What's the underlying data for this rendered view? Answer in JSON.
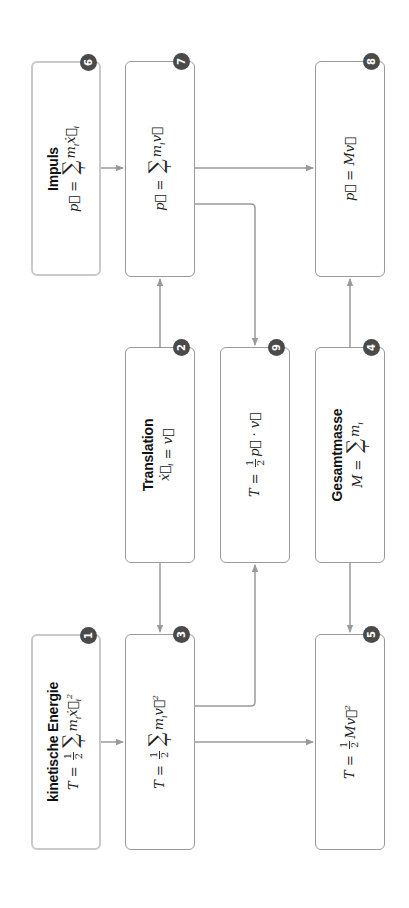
{
  "diagram": {
    "language": "de",
    "colors": {
      "box_border": "#9a9a9a",
      "box_border_light": "#c9c9c9",
      "badge_fill": "#4a4a4a",
      "badge_text": "#ffffff",
      "connector": "#9a9a9a"
    },
    "boxes": [
      {
        "id": 1,
        "badge": "1",
        "title": "kinetische Energie",
        "formula": "T = 1/2 Σ_i m_i ẋ_i²",
        "formula_parts": {
          "lhs": "T =",
          "frac_num": "1",
          "frac_den": "2",
          "sum_index": "i",
          "term": "m",
          "term_sub": "i",
          "term2": "ẋ",
          "term2_sub": "i",
          "term2_sup": "2"
        }
      },
      {
        "id": 2,
        "badge": "2",
        "title": "Translation",
        "formula": "ẋ_i = v",
        "formula_parts": {
          "lhs": "ẋ",
          "lhs_sub": "i",
          "eq": "=",
          "rhs": "v"
        }
      },
      {
        "id": 3,
        "badge": "3",
        "title": "",
        "formula": "T = 1/2 Σ_i m_i v²",
        "formula_parts": {
          "lhs": "T =",
          "frac_num": "1",
          "frac_den": "2",
          "sum_index": "i",
          "term": "m",
          "term_sub": "i",
          "term2": "v",
          "term2_sup": "2"
        }
      },
      {
        "id": 4,
        "badge": "4",
        "title": "Gesamtmasse",
        "formula": "M = Σ_i m_i",
        "formula_parts": {
          "lhs": "M =",
          "sum_index": "i",
          "term": "m",
          "term_sub": "i"
        }
      },
      {
        "id": 5,
        "badge": "5",
        "title": "",
        "formula": "T = 1/2 M v²",
        "formula_parts": {
          "lhs": "T =",
          "frac_num": "1",
          "frac_den": "2",
          "term": "M",
          "term2": "v",
          "term2_sup": "2"
        }
      },
      {
        "id": 6,
        "badge": "6",
        "title": "Impuls",
        "formula": "p = Σ_i m_i ẋ_i",
        "formula_parts": {
          "lhs": "p =",
          "sum_index": "i",
          "term": "m",
          "term_sub": "i",
          "term2": "ẋ",
          "term2_sub": "i"
        }
      },
      {
        "id": 7,
        "badge": "7",
        "title": "",
        "formula": "p = Σ_i m_i v",
        "formula_parts": {
          "lhs": "p =",
          "sum_index": "i",
          "term": "m",
          "term_sub": "i",
          "term2": "v"
        }
      },
      {
        "id": 8,
        "badge": "8",
        "title": "",
        "formula": "p = M v",
        "formula_parts": {
          "lhs": "p =",
          "term": "M",
          "term2": "v"
        }
      },
      {
        "id": 9,
        "badge": "9",
        "title": "",
        "formula": "T = 1/2 p · v",
        "formula_parts": {
          "lhs": "T =",
          "frac_num": "1",
          "frac_den": "2",
          "term": "p",
          "dot": "·",
          "term2": "v"
        }
      }
    ],
    "connections": [
      {
        "from": 1,
        "to": 3
      },
      {
        "from": 2,
        "to": 3
      },
      {
        "from": 2,
        "to": 7
      },
      {
        "from": 6,
        "to": 7
      },
      {
        "from": 3,
        "to": 5
      },
      {
        "from": 3,
        "to": 9
      },
      {
        "from": 7,
        "to": 9
      },
      {
        "from": 7,
        "to": 8
      },
      {
        "from": 4,
        "to": 5
      },
      {
        "from": 4,
        "to": 8
      }
    ]
  }
}
